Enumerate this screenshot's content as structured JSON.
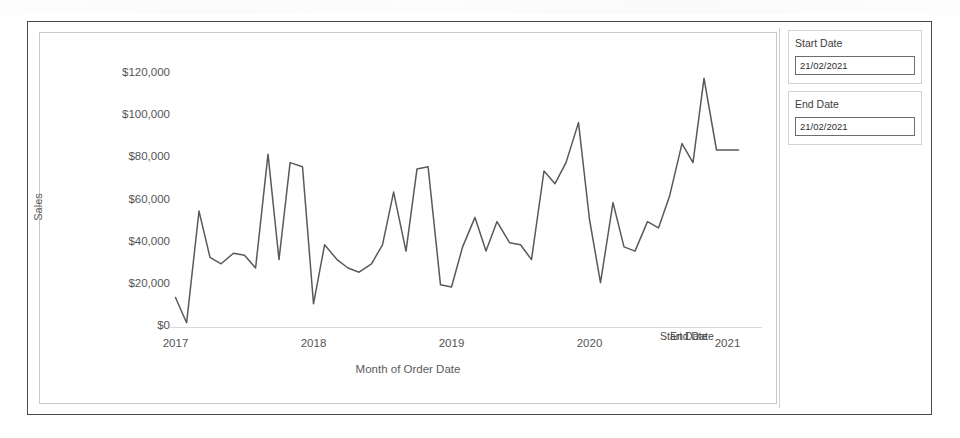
{
  "panel": {
    "start": {
      "label": "Start Date",
      "value": "21/02/2021"
    },
    "end": {
      "label": "End Date",
      "value": "21/02/2021"
    }
  },
  "reference_lines": [
    {
      "name": "start-date-reference-label",
      "label": "Start Date"
    },
    {
      "name": "end-date-reference-label",
      "label": "End Date"
    }
  ],
  "chart_data": {
    "type": "line",
    "title": "",
    "xlabel": "Month of Order Date",
    "ylabel": "Sales",
    "ylim": [
      0,
      130000
    ],
    "yticks": [
      0,
      20000,
      40000,
      60000,
      80000,
      100000,
      120000
    ],
    "ytick_labels": [
      "$0",
      "$20,000",
      "$40,000",
      "$60,000",
      "$80,000",
      "$100,000",
      "$120,000"
    ],
    "xticks": [
      2017,
      2018,
      2019,
      2020,
      2021
    ],
    "xtick_labels": [
      "2017",
      "2018",
      "2019",
      "2020",
      "2021"
    ],
    "xlim": [
      2016.96,
      2021.25
    ],
    "grid": false,
    "line_color": "#595959",
    "legend": "none",
    "x": [
      2017.0,
      2017.08,
      2017.17,
      2017.25,
      2017.33,
      2017.42,
      2017.5,
      2017.58,
      2017.67,
      2017.75,
      2017.83,
      2017.92,
      2018.0,
      2018.08,
      2018.17,
      2018.25,
      2018.33,
      2018.42,
      2018.5,
      2018.58,
      2018.67,
      2018.75,
      2018.83,
      2018.92,
      2019.0,
      2019.08,
      2019.17,
      2019.25,
      2019.33,
      2019.42,
      2019.5,
      2019.58,
      2019.67,
      2019.75,
      2019.83,
      2019.92,
      2020.0,
      2020.08,
      2020.17,
      2020.25,
      2020.33,
      2020.42,
      2020.5,
      2020.58,
      2020.67,
      2020.75,
      2020.83,
      2020.92,
      2021.0,
      2021.08
    ],
    "categories": [
      "Jan 2017",
      "Feb 2017",
      "Mar 2017",
      "Apr 2017",
      "May 2017",
      "Jun 2017",
      "Jul 2017",
      "Aug 2017",
      "Sep 2017",
      "Oct 2017",
      "Nov 2017",
      "Dec 2017",
      "Jan 2018",
      "Feb 2018",
      "Mar 2018",
      "Apr 2018",
      "May 2018",
      "Jun 2018",
      "Jul 2018",
      "Aug 2018",
      "Sep 2018",
      "Oct 2018",
      "Nov 2018",
      "Dec 2018",
      "Jan 2019",
      "Feb 2019",
      "Mar 2019",
      "Apr 2019",
      "May 2019",
      "Jun 2019",
      "Jul 2019",
      "Aug 2019",
      "Sep 2019",
      "Oct 2019",
      "Nov 2019",
      "Dec 2019",
      "Jan 2020",
      "Feb 2020",
      "Mar 2020",
      "Apr 2020",
      "May 2020",
      "Jun 2020",
      "Jul 2020",
      "Aug 2020",
      "Sep 2020",
      "Oct 2020",
      "Nov 2020",
      "Dec 2020",
      "Jan 2021",
      "Feb 2021"
    ],
    "values": [
      14000,
      2000,
      55000,
      33000,
      30000,
      35000,
      34000,
      28000,
      82000,
      32000,
      78000,
      76000,
      11000,
      39000,
      32000,
      28000,
      26000,
      30000,
      39000,
      64000,
      36000,
      75000,
      76000,
      20000,
      19000,
      38000,
      52000,
      36000,
      50000,
      40000,
      39000,
      32000,
      74000,
      68000,
      78000,
      97000,
      51000,
      21000,
      59000,
      38000,
      36000,
      50000,
      47000,
      62000,
      87000,
      78000,
      118000,
      84000,
      84000,
      84000
    ],
    "series": [
      {
        "name": "Sales",
        "color": "#595959"
      }
    ]
  }
}
